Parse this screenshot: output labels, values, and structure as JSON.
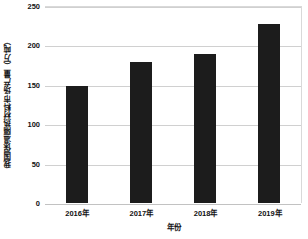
{
  "chart_data": {
    "type": "bar",
    "title": "",
    "categories": [
      "2016年",
      "2017年",
      "2018年",
      "2019年"
    ],
    "values": [
      148,
      179,
      189,
      227
    ],
    "series": [
      {
        "name": "我国保温隔热材料市场产量",
        "values": [
          148,
          179,
          189,
          227
        ]
      }
    ],
    "xlabel": "年份",
    "ylabel": "我国保温隔热材料市场产量（万吨）",
    "ylim": [
      0,
      250
    ],
    "yticks": [
      0,
      50,
      100,
      150,
      200,
      250
    ],
    "ytick_labels": [
      "0",
      "50",
      "100",
      "150",
      "200",
      "250"
    ],
    "grid": "horizontal",
    "legend": "none",
    "bar_color": "#1c1c1c",
    "grid_color": "#d0d0d0",
    "background_color": "#ffffff"
  }
}
